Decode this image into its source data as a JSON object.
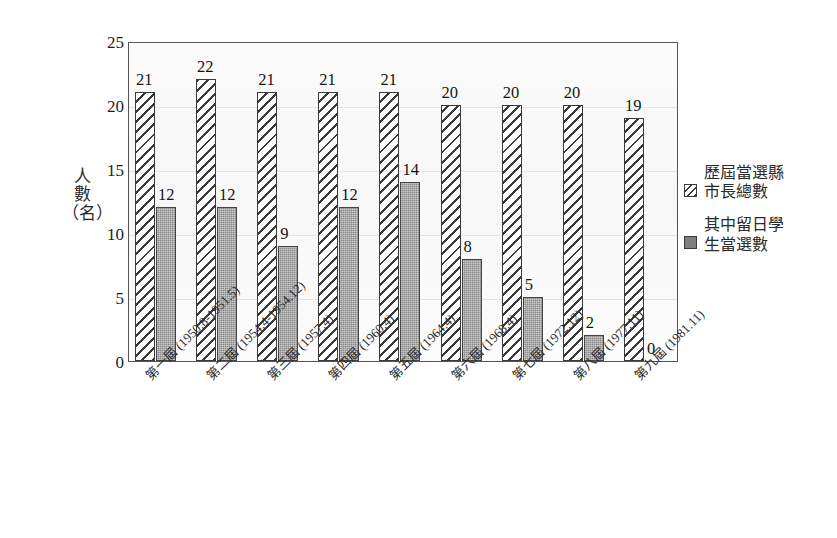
{
  "chart_data": {
    "type": "bar",
    "title": "",
    "subtitle": "",
    "xlabel": "",
    "ylabel": "人數（名）",
    "ylabel_chars": [
      "人",
      "數",
      "（",
      "名",
      "）"
    ],
    "ylim": [
      0,
      25
    ],
    "ytick_values": [
      0,
      5,
      10,
      15,
      20,
      25
    ],
    "ytick_labels": [
      "0",
      "5",
      "10",
      "15",
      "20",
      "25"
    ],
    "grid": true,
    "grid_axis": "y",
    "legend_position": "right",
    "categories": [
      "第一屆 (1950.8-1951.5)",
      "第二屆 (1954.4-1954.12)",
      "第三屆 (1957.4)",
      "第四屆 (1960.4)",
      "第五屆 (1964.4)",
      "第六屆 (1968.4)",
      "第七屆 (1972.12)",
      "第八屆 (1977.11)",
      "第九屆 (1981.11)"
    ],
    "series": [
      {
        "name": "歷屆當選縣市長總數",
        "name_lines": [
          "歷屆當選縣",
          "市長總數"
        ],
        "pattern": "diagonal-hatch",
        "color": "#ffffff",
        "values": [
          21,
          22,
          21,
          21,
          21,
          20,
          20,
          20,
          19
        ]
      },
      {
        "name": "其中留日學生當選數",
        "name_lines": [
          "其中留日學",
          "生當選數"
        ],
        "pattern": "solid-gray",
        "color": "#7f7f7f",
        "values": [
          12,
          12,
          9,
          12,
          14,
          8,
          5,
          2,
          0
        ]
      }
    ]
  },
  "colors": {
    "axis": "#555555",
    "bar_outline": "#3a3a3a",
    "gray_fill": "#7f7f7f",
    "gridline": "#e3e3e8",
    "background": "#ffffff",
    "plot_background": "#fbfbfb"
  }
}
